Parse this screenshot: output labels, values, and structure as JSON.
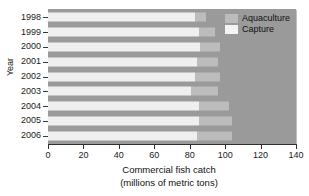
{
  "chart_data": {
    "type": "bar",
    "orientation": "horizontal",
    "stacked": true,
    "title": "",
    "xlabel": "Commercial fish catch",
    "xlabel_line2": "(millions of metric tons)",
    "ylabel": "Year",
    "categories": [
      "1998",
      "1999",
      "2000",
      "2001",
      "2002",
      "2003",
      "2004",
      "2005",
      "2006"
    ],
    "series": [
      {
        "name": "Capture",
        "color": "#efefef",
        "values": [
          83,
          85,
          86,
          84,
          83,
          81,
          85,
          85,
          84
        ]
      },
      {
        "name": "Aquaculture",
        "color": "#bcbcbc",
        "values": [
          6,
          9,
          11,
          12,
          14,
          15,
          17,
          19,
          20
        ]
      }
    ],
    "totals": [
      89,
      94,
      97,
      96,
      97,
      96,
      102,
      104,
      104
    ],
    "xlim": [
      0,
      140
    ],
    "xticks": [
      0,
      20,
      40,
      60,
      80,
      100,
      120,
      140
    ],
    "xtick_labels": [
      "0",
      "20",
      "40",
      "60",
      "80",
      "100",
      "120",
      "140"
    ],
    "grid": false,
    "legend_position": "top-right",
    "panel_color": "#9a9a9a"
  },
  "legend": {
    "items": [
      {
        "label": "Aquaculture",
        "swatch": "aqua"
      },
      {
        "label": "Capture",
        "swatch": "capture"
      }
    ]
  }
}
